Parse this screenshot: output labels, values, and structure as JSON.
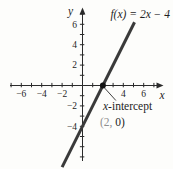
{
  "chart_data": {
    "type": "line",
    "title": "f(x) = 2x − 4",
    "xlabel": "x",
    "ylabel": "y",
    "xlim": [
      -7.5,
      8
    ],
    "ylim": [
      -8.5,
      8
    ],
    "grid": false,
    "tick_step": 1,
    "x_tick_range": [
      -7,
      7
    ],
    "y_tick_range": [
      -7,
      7
    ],
    "x_tick_labels": [
      -6,
      -4,
      -2,
      4,
      6
    ],
    "y_tick_labels": [
      -4,
      -2,
      2,
      4,
      6
    ],
    "series": [
      {
        "name": "f(x) = 2x − 4",
        "slope": 2,
        "y_intercept": -4,
        "x_start": -2.0,
        "x_end": 5.1,
        "color": "#3a3a3a",
        "stroke_width": 3
      }
    ],
    "points": [
      {
        "x": 2,
        "y": 0,
        "radius": 3,
        "color": "#141414"
      }
    ],
    "annotation": {
      "label_prefix": "x",
      "label_suffix": "-intercept",
      "coord_highlight": "(2,",
      "coord_rest": " 0)",
      "target_x": 2,
      "target_y": 0
    },
    "colors": {
      "axis": "#2b2b2b",
      "text": "#1e1e1e",
      "muted": "#8f8f8f",
      "line": "#3a3a3a",
      "background": "#fdfdfb"
    }
  }
}
